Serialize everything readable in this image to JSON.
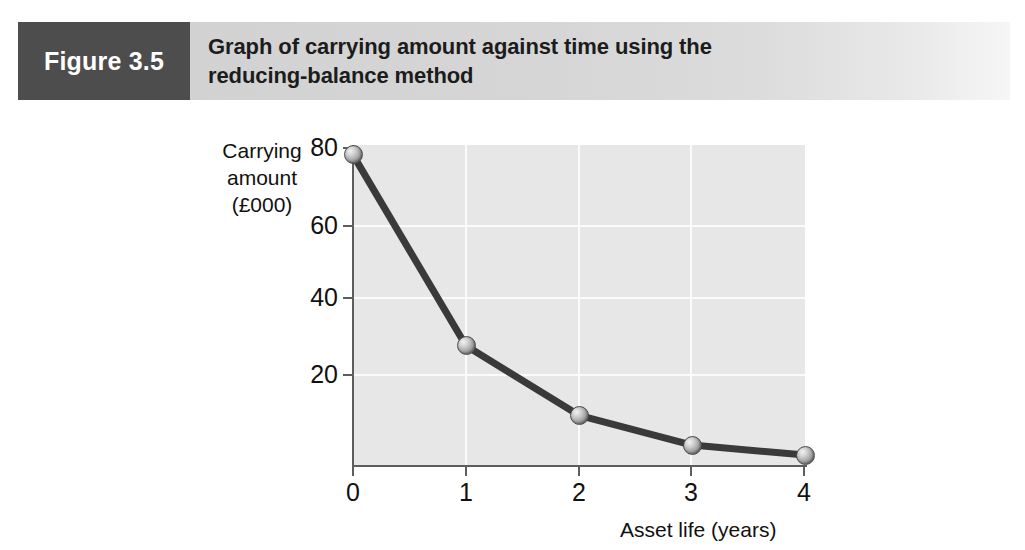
{
  "figure": {
    "number_label": "Figure 3.5",
    "title": "Graph of carrying amount against time using the\nreducing-balance method",
    "number_block_color": "#4d4d4d",
    "title_bar_color": "#d4d4d4"
  },
  "chart_data": {
    "type": "line",
    "title": "Graph of carrying amount against time using the reducing-balance method",
    "xlabel": "Asset life (years)",
    "ylabel": "Carrying amount (£000)",
    "ylabel_lines": "Carrying\namount\n(£000)",
    "x": [
      0,
      1,
      2,
      3,
      4
    ],
    "values": [
      78,
      30,
      12.5,
      5,
      2.5
    ],
    "series": [
      {
        "name": "Carrying amount (reducing-balance)",
        "values": [
          78,
          30,
          12.5,
          5,
          2.5
        ]
      }
    ],
    "x_tick_labels": [
      "0",
      "1",
      "2",
      "3",
      "4"
    ],
    "y_tick_labels": [
      "80",
      "60",
      "40",
      "20"
    ],
    "y_ticks": [
      80,
      60,
      40,
      20
    ],
    "xlim": [
      0,
      4
    ],
    "ylim": [
      0,
      84
    ],
    "grid": true,
    "grid_color": "#fbfbfb",
    "plot_background": "#e7e7e7",
    "line_color": "#3a3a3a",
    "marker_color": "#9d9d9d",
    "legend": "none"
  }
}
